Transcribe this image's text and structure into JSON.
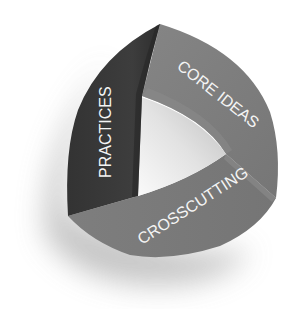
{
  "diagram": {
    "type": "three-band triangle",
    "bands": [
      {
        "id": "practices",
        "label": "PRACTICES",
        "color": "#3a3a3a"
      },
      {
        "id": "core_ideas",
        "label": "CORE IDEAS",
        "color": "#7c7c7c"
      },
      {
        "id": "crosscutting",
        "label": "CROSSCUTTING",
        "color": "#7a7a7a"
      }
    ],
    "inner_color": "#e4e4e4",
    "shadow_color": "#c8c8c8",
    "background": "#ffffff"
  }
}
